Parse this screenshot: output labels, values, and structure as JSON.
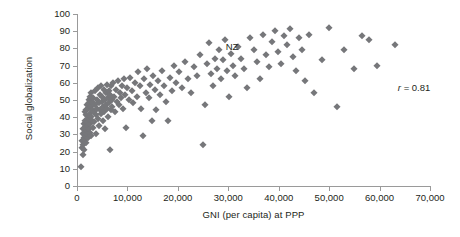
{
  "chart_data": {
    "type": "scatter",
    "title": "",
    "xlabel": "GNI (per capita) at PPP",
    "ylabel": "Social globalization",
    "xlim": [
      0,
      70000
    ],
    "ylim": [
      0,
      100
    ],
    "grid": false,
    "legend": null,
    "xticks": [
      0,
      10000,
      20000,
      30000,
      40000,
      50000,
      60000,
      70000
    ],
    "xtick_labels": [
      "0",
      "10,000",
      "20,000",
      "30,000",
      "40,000",
      "50,000",
      "60,000",
      "70,000"
    ],
    "yticks": [
      0,
      10,
      20,
      30,
      40,
      50,
      60,
      70,
      80,
      90,
      100
    ],
    "ytick_labels": [
      "0",
      "10",
      "20",
      "30",
      "40",
      "50",
      "60",
      "70",
      "80",
      "90",
      "100"
    ],
    "marker": "diamond",
    "marker_color": "#76777a",
    "annotations": [
      {
        "id": "nz",
        "text": "NZ",
        "x": 29500,
        "y": 81
      },
      {
        "id": "correlation",
        "text": "r = 0.81",
        "r_symbol": "r",
        "r_value": "= 0.81",
        "x": 66000,
        "y": 57
      }
    ],
    "points": [
      [
        700,
        11
      ],
      [
        900,
        22
      ],
      [
        1000,
        26
      ],
      [
        1100,
        18
      ],
      [
        1150,
        30
      ],
      [
        1200,
        24
      ],
      [
        1250,
        33
      ],
      [
        1300,
        28
      ],
      [
        1350,
        21
      ],
      [
        1400,
        36
      ],
      [
        1450,
        31
      ],
      [
        1500,
        43
      ],
      [
        1550,
        27
      ],
      [
        1600,
        38
      ],
      [
        1650,
        34
      ],
      [
        1700,
        29
      ],
      [
        1750,
        41
      ],
      [
        1800,
        25
      ],
      [
        1850,
        44
      ],
      [
        1900,
        32
      ],
      [
        1950,
        37
      ],
      [
        2000,
        47
      ],
      [
        2050,
        30
      ],
      [
        2100,
        40
      ],
      [
        2150,
        35
      ],
      [
        2200,
        45
      ],
      [
        2250,
        28
      ],
      [
        2300,
        50
      ],
      [
        2350,
        39
      ],
      [
        2400,
        33
      ],
      [
        2450,
        48
      ],
      [
        2500,
        42
      ],
      [
        2550,
        36
      ],
      [
        2600,
        52
      ],
      [
        2650,
        31
      ],
      [
        2700,
        46
      ],
      [
        2750,
        40
      ],
      [
        2800,
        29
      ],
      [
        2850,
        54
      ],
      [
        2900,
        44
      ],
      [
        2950,
        38
      ],
      [
        3000,
        49
      ],
      [
        3100,
        34
      ],
      [
        3200,
        51
      ],
      [
        3300,
        43
      ],
      [
        3400,
        37
      ],
      [
        3500,
        47
      ],
      [
        3600,
        55
      ],
      [
        3700,
        41
      ],
      [
        3800,
        30
      ],
      [
        3900,
        50
      ],
      [
        4000,
        45
      ],
      [
        4100,
        57
      ],
      [
        4200,
        39
      ],
      [
        4300,
        48
      ],
      [
        4400,
        35
      ],
      [
        4500,
        53
      ],
      [
        4600,
        44
      ],
      [
        4700,
        58
      ],
      [
        4800,
        42
      ],
      [
        4900,
        49
      ],
      [
        5000,
        52
      ],
      [
        5100,
        38
      ],
      [
        5200,
        46
      ],
      [
        5300,
        56
      ],
      [
        5400,
        43
      ],
      [
        5500,
        50
      ],
      [
        5600,
        33
      ],
      [
        5700,
        54
      ],
      [
        5800,
        47
      ],
      [
        5900,
        59
      ],
      [
        6000,
        45
      ],
      [
        6100,
        51
      ],
      [
        6200,
        40
      ],
      [
        6300,
        55
      ],
      [
        6400,
        48
      ],
      [
        6500,
        21
      ],
      [
        6600,
        53
      ],
      [
        6700,
        44
      ],
      [
        6800,
        58
      ],
      [
        6900,
        50
      ],
      [
        7000,
        46
      ],
      [
        7200,
        60
      ],
      [
        7400,
        52
      ],
      [
        7600,
        43
      ],
      [
        7800,
        56
      ],
      [
        8000,
        49
      ],
      [
        8200,
        61
      ],
      [
        8400,
        47
      ],
      [
        8600,
        54
      ],
      [
        8800,
        51
      ],
      [
        9000,
        58
      ],
      [
        9200,
        45
      ],
      [
        9400,
        62
      ],
      [
        9600,
        53
      ],
      [
        9800,
        34
      ],
      [
        10000,
        57
      ],
      [
        10300,
        50
      ],
      [
        10600,
        63
      ],
      [
        10900,
        55
      ],
      [
        11200,
        48
      ],
      [
        11500,
        60
      ],
      [
        11800,
        52
      ],
      [
        12100,
        66
      ],
      [
        12400,
        58
      ],
      [
        12700,
        45
      ],
      [
        13000,
        29
      ],
      [
        13300,
        62
      ],
      [
        13600,
        54
      ],
      [
        13900,
        68
      ],
      [
        14200,
        51
      ],
      [
        14500,
        59
      ],
      [
        14800,
        38
      ],
      [
        15100,
        64
      ],
      [
        15400,
        56
      ],
      [
        15700,
        44
      ],
      [
        16000,
        61
      ],
      [
        16400,
        53
      ],
      [
        16800,
        67
      ],
      [
        17200,
        58
      ],
      [
        17600,
        49
      ],
      [
        18000,
        38
      ],
      [
        18400,
        63
      ],
      [
        18800,
        55
      ],
      [
        19200,
        70
      ],
      [
        19600,
        60
      ],
      [
        20200,
        66
      ],
      [
        20800,
        57
      ],
      [
        21400,
        72
      ],
      [
        22000,
        62
      ],
      [
        22600,
        54
      ],
      [
        23200,
        69
      ],
      [
        23800,
        64
      ],
      [
        24400,
        76
      ],
      [
        25000,
        24
      ],
      [
        25400,
        47
      ],
      [
        25800,
        71
      ],
      [
        26200,
        83
      ],
      [
        26600,
        65
      ],
      [
        27000,
        58
      ],
      [
        27400,
        74
      ],
      [
        27800,
        68
      ],
      [
        28200,
        79
      ],
      [
        28600,
        62
      ],
      [
        29000,
        73
      ],
      [
        29400,
        85
      ],
      [
        29800,
        67
      ],
      [
        30200,
        52
      ],
      [
        30600,
        77
      ],
      [
        31000,
        70
      ],
      [
        31400,
        64
      ],
      [
        32000,
        81
      ],
      [
        32600,
        74
      ],
      [
        33200,
        68
      ],
      [
        33800,
        57
      ],
      [
        34400,
        86
      ],
      [
        35000,
        79
      ],
      [
        35600,
        72
      ],
      [
        36200,
        62
      ],
      [
        36800,
        88
      ],
      [
        37400,
        76
      ],
      [
        38000,
        69
      ],
      [
        38600,
        84
      ],
      [
        39200,
        90
      ],
      [
        39800,
        78
      ],
      [
        40400,
        71
      ],
      [
        41000,
        87
      ],
      [
        41600,
        82
      ],
      [
        42200,
        91
      ],
      [
        42800,
        75
      ],
      [
        43400,
        67
      ],
      [
        44000,
        86
      ],
      [
        44600,
        79
      ],
      [
        45200,
        61
      ],
      [
        46000,
        88
      ],
      [
        47000,
        54
      ],
      [
        48500,
        73
      ],
      [
        50000,
        92
      ],
      [
        51500,
        46
      ],
      [
        53000,
        79
      ],
      [
        55000,
        68
      ],
      [
        56500,
        87
      ],
      [
        58000,
        85
      ],
      [
        59500,
        70
      ],
      [
        63000,
        82
      ]
    ]
  }
}
